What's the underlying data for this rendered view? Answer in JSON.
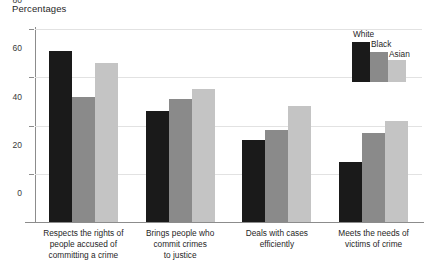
{
  "chart_data": {
    "type": "bar",
    "title": "Percentages",
    "xlabel": "",
    "ylabel": "",
    "ylim": [
      0,
      80
    ],
    "yticks": [
      0,
      20,
      40,
      60,
      80
    ],
    "grid": true,
    "legend_position": "top-right",
    "categories": [
      "Respects the rights of\npeople accused of\ncommitting a crime",
      "Brings people who\ncommit crimes\nto justice",
      "Deals with cases\nefficiently",
      "Meets the needs of\nvictims of crime"
    ],
    "series": [
      {
        "name": "White",
        "color": "#1a1a1a",
        "values": [
          71,
          46,
          34,
          25
        ]
      },
      {
        "name": "Black",
        "color": "#8a8a8a",
        "values": [
          52,
          51,
          38,
          37
        ]
      },
      {
        "name": "Asian",
        "color": "#c4c4c4",
        "values": [
          66,
          55,
          48,
          42
        ]
      }
    ]
  }
}
